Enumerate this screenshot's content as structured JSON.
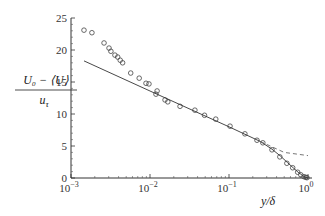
{
  "chart_data": {
    "type": "scatter",
    "title": "",
    "xlabel": "y/δ",
    "ylabel": "U₀ − ⟨U⟩ / u_τ",
    "ylabel_numerator": "U₀ − ⟨U⟩",
    "ylabel_denominator": "u",
    "ylabel_denominator_sub": "τ",
    "xscale": "log",
    "xlim": [
      0.001,
      1
    ],
    "ylim": [
      0,
      25
    ],
    "grid": false,
    "legend": null,
    "x_ticks": [
      {
        "value": 0.001,
        "base": "10",
        "exp": "−3"
      },
      {
        "value": 0.01,
        "base": "10",
        "exp": "−2"
      },
      {
        "value": 0.1,
        "base": "10",
        "exp": "−1"
      },
      {
        "value": 1,
        "base": "10",
        "exp": "0"
      }
    ],
    "y_ticks": [
      0,
      5,
      10,
      15,
      20,
      25
    ],
    "series": [
      {
        "name": "data",
        "style": "open-circle",
        "x": [
          0.00146,
          0.00184,
          0.00262,
          0.00303,
          0.0032,
          0.0036,
          0.0039,
          0.0042,
          0.0045,
          0.0057,
          0.0073,
          0.0089,
          0.0097,
          0.0119,
          0.0123,
          0.0155,
          0.0168,
          0.024,
          0.037,
          0.049,
          0.068,
          0.103,
          0.159,
          0.226,
          0.268,
          0.35,
          0.44,
          0.54,
          0.64,
          0.74,
          0.81,
          0.89,
          0.94,
          0.97
        ],
        "y": [
          23.1,
          22.7,
          21.1,
          20.3,
          19.8,
          19.2,
          18.9,
          18.4,
          18.0,
          16.4,
          15.6,
          14.8,
          14.7,
          13.1,
          13.6,
          12.2,
          11.9,
          11.2,
          10.6,
          9.8,
          9.2,
          8.1,
          6.9,
          5.9,
          5.5,
          4.4,
          3.3,
          2.3,
          1.6,
          0.9,
          0.5,
          0.2,
          0.1,
          0.05
        ]
      },
      {
        "name": "log-law + wake fit",
        "style": "solid-line",
        "x": [
          0.00146,
          0.01,
          0.1,
          0.25,
          0.35,
          0.45,
          0.55,
          0.65,
          0.75,
          0.85,
          0.93,
          1.0
        ],
        "y": [
          18.3,
          13.6,
          8.0,
          5.7,
          4.5,
          3.4,
          2.4,
          1.6,
          0.9,
          0.4,
          0.1,
          0.0
        ]
      },
      {
        "name": "log-law extension",
        "style": "dashed-line",
        "x": [
          0.25,
          0.5,
          1.0
        ],
        "y": [
          5.7,
          4.0,
          3.5
        ]
      }
    ]
  }
}
